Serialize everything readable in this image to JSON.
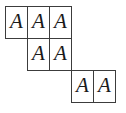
{
  "figure": {
    "type": "skew-tableau",
    "background_color": "#ffffff",
    "border_color": "#3c3c3c",
    "text_color": "#1a1a1a",
    "cell_width": 22,
    "cell_height": 32,
    "rows": [
      {
        "row_index": 0,
        "offset_columns": 0,
        "cells": [
          {
            "label": "A",
            "col": 0,
            "x": 5,
            "y": 6,
            "w": 23,
            "h": 33
          },
          {
            "label": "A",
            "col": 1,
            "x": 27,
            "y": 6,
            "w": 23,
            "h": 33
          },
          {
            "label": "A",
            "col": 2,
            "x": 49,
            "y": 6,
            "w": 23,
            "h": 33
          }
        ]
      },
      {
        "row_index": 1,
        "offset_columns": 1,
        "cells": [
          {
            "label": "A",
            "col": 1,
            "x": 27,
            "y": 38,
            "w": 23,
            "h": 33
          },
          {
            "label": "A",
            "col": 2,
            "x": 49,
            "y": 38,
            "w": 23,
            "h": 33
          }
        ]
      },
      {
        "row_index": 2,
        "offset_columns": 3,
        "cells": [
          {
            "label": "A",
            "col": 3,
            "x": 71,
            "y": 70,
            "w": 23,
            "h": 33
          },
          {
            "label": "A",
            "col": 4,
            "x": 93,
            "y": 70,
            "w": 23,
            "h": 33
          }
        ]
      }
    ]
  }
}
